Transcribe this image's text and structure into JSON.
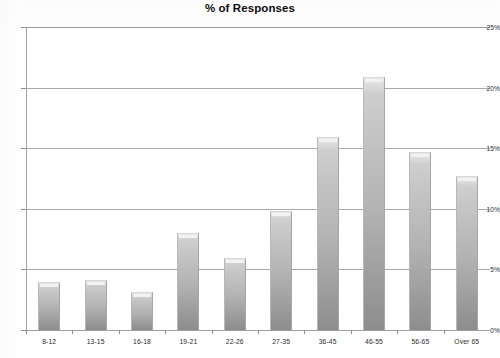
{
  "chart_data": {
    "type": "bar",
    "title": "% of Responses",
    "xlabel": "",
    "ylabel": "",
    "categories": [
      "8-12",
      "13-15",
      "16-18",
      "19-21",
      "22-26",
      "27-35",
      "36-45",
      "46-55",
      "56-65",
      "Over 65"
    ],
    "values": [
      4.0,
      4.1,
      3.1,
      8.0,
      5.9,
      9.8,
      15.9,
      20.9,
      14.7,
      12.7
    ],
    "ylim": [
      0,
      25
    ],
    "ytick_values": [
      0,
      5,
      10,
      15,
      20,
      25
    ],
    "ytick_labels": [
      "0%",
      "5%",
      "10%",
      "15%",
      "20%",
      "25%"
    ],
    "grid": true,
    "legend": "none",
    "bar_color": "#b3b3b3",
    "gridline_color": "#a9a9a9",
    "background_color": "#ffffff"
  }
}
